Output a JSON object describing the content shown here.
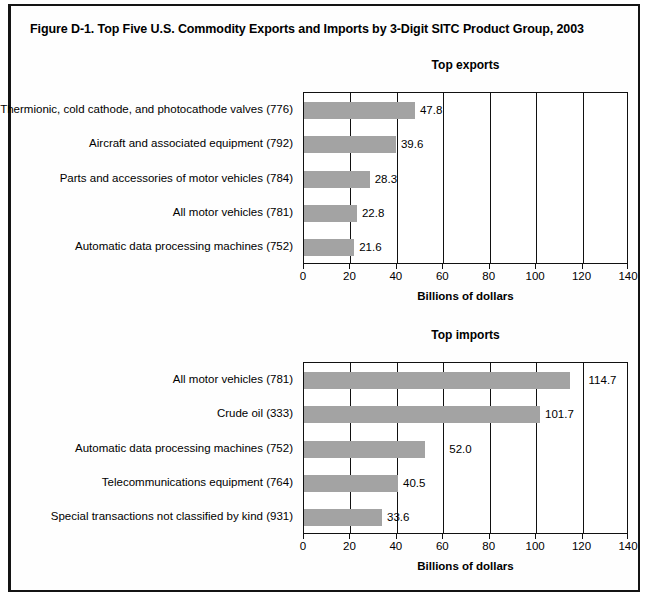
{
  "figure": {
    "title": "Figure D-1. Top Five U.S. Commodity Exports and Imports by 3-Digit SITC Product Group, 2003"
  },
  "axis": {
    "title": "Billions of dollars",
    "ticks": [
      "0",
      "20",
      "40",
      "60",
      "80",
      "100",
      "120",
      "140"
    ]
  },
  "charts": [
    {
      "key": "exports",
      "title": "Top exports",
      "categories": [
        "Thermionic, cold cathode, and photocathode valves (776)",
        "Aircraft and associated equipment (792)",
        "Parts and accessories of motor vehicles (784)",
        "All motor vehicles (781)",
        "Automatic data processing machines (752)"
      ],
      "values": [
        47.8,
        39.6,
        28.3,
        22.8,
        21.6
      ],
      "value_labels": [
        "47.8",
        "39.6",
        "28.3",
        "22.8",
        "21.6"
      ]
    },
    {
      "key": "imports",
      "title": "Top imports",
      "categories": [
        "All motor vehicles (781)",
        "Crude oil (333)",
        "Automatic data processing machines (752)",
        "Telecommunications equipment (764)",
        "Special transactions not classified by kind (931)"
      ],
      "values": [
        114.7,
        101.7,
        52.0,
        40.5,
        33.6
      ],
      "value_labels": [
        "114.7",
        "101.7",
        "52.0",
        "40.5",
        "33.6"
      ]
    }
  ],
  "chart_data": [
    {
      "type": "bar",
      "orientation": "horizontal",
      "title": "Top exports",
      "categories": [
        "Thermionic, cold cathode, and photocathode valves (776)",
        "Aircraft and associated equipment (792)",
        "Parts and accessories of motor vehicles (784)",
        "All motor vehicles (781)",
        "Automatic data processing machines (752)"
      ],
      "values": [
        47.8,
        39.6,
        28.3,
        22.8,
        21.6
      ],
      "xlabel": "Billions of dollars",
      "ylabel": "",
      "xlim": [
        0,
        140
      ],
      "xticks": [
        0,
        20,
        40,
        60,
        80,
        100,
        120,
        140
      ],
      "grid": "vertical",
      "legend": "none",
      "bar_color": "#a3a3a3",
      "data_labels": true
    },
    {
      "type": "bar",
      "orientation": "horizontal",
      "title": "Top imports",
      "categories": [
        "All motor vehicles (781)",
        "Crude oil (333)",
        "Automatic data processing machines (752)",
        "Telecommunications equipment (764)",
        "Special transactions not classified by kind (931)"
      ],
      "values": [
        114.7,
        101.7,
        52.0,
        40.5,
        33.6
      ],
      "xlabel": "Billions of dollars",
      "ylabel": "",
      "xlim": [
        0,
        140
      ],
      "xticks": [
        0,
        20,
        40,
        60,
        80,
        100,
        120,
        140
      ],
      "grid": "vertical",
      "legend": "none",
      "bar_color": "#a3a3a3",
      "data_labels": true
    }
  ]
}
